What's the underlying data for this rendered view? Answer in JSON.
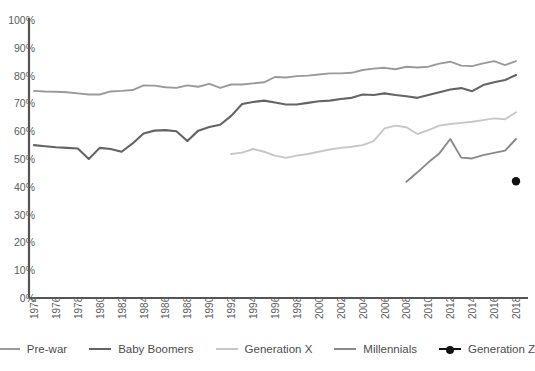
{
  "chart_data": {
    "type": "line",
    "title": "",
    "xlabel": "",
    "ylabel": "",
    "xlim": [
      1974,
      2018
    ],
    "ylim": [
      0,
      100
    ],
    "grid": false,
    "legend_position": "bottom",
    "y_ticks": [
      "100%",
      "90%",
      "80%",
      "70%",
      "60%",
      "50%",
      "40%",
      "30%",
      "20%",
      "10%",
      "0%"
    ],
    "y_tick_values": [
      100,
      90,
      80,
      70,
      60,
      50,
      40,
      30,
      20,
      10,
      0
    ],
    "x_ticks": [
      "1974",
      "1976",
      "1978",
      "1980",
      "1982",
      "1984",
      "1986",
      "1988",
      "1990",
      "1992",
      "1994",
      "1996",
      "1998",
      "2000",
      "2002",
      "2004",
      "2006",
      "2008",
      "2010",
      "2012",
      "2014",
      "2016",
      "2018"
    ],
    "x_tick_values": [
      1974,
      1976,
      1978,
      1980,
      1982,
      1984,
      1986,
      1988,
      1990,
      1992,
      1994,
      1996,
      1998,
      2000,
      2002,
      2004,
      2006,
      2008,
      2010,
      2012,
      2014,
      2016,
      2018
    ],
    "series": [
      {
        "name": "Pre-war",
        "color": "#9a9a9a",
        "width": 1.9,
        "marker": "none",
        "x": [
          1974,
          1975,
          1976,
          1977,
          1978,
          1979,
          1980,
          1981,
          1982,
          1983,
          1984,
          1985,
          1986,
          1987,
          1988,
          1989,
          1990,
          1991,
          1992,
          1993,
          1994,
          1995,
          1996,
          1997,
          1998,
          1999,
          2000,
          2001,
          2002,
          2003,
          2004,
          2005,
          2006,
          2007,
          2008,
          2009,
          2010,
          2011,
          2012,
          2013,
          2014,
          2015,
          2016,
          2017,
          2018
        ],
        "values": [
          74.5,
          74.3,
          74.2,
          74.0,
          73.6,
          73.2,
          73.2,
          74.3,
          74.5,
          74.8,
          76.5,
          76.4,
          75.8,
          75.6,
          76.5,
          76.0,
          77.0,
          75.6,
          76.8,
          76.8,
          77.2,
          77.6,
          79.5,
          79.3,
          79.8,
          80.0,
          80.4,
          80.8,
          80.8,
          81.0,
          82.0,
          82.5,
          82.8,
          82.3,
          83.2,
          82.9,
          83.2,
          84.3,
          85.0,
          83.6,
          83.4,
          84.4,
          85.2,
          83.8,
          85.2
        ]
      },
      {
        "name": "Baby Boomers",
        "color": "#646464",
        "width": 2.1,
        "marker": "none",
        "x": [
          1974,
          1975,
          1976,
          1977,
          1978,
          1979,
          1980,
          1981,
          1982,
          1983,
          1984,
          1985,
          1986,
          1987,
          1988,
          1989,
          1990,
          1991,
          1992,
          1993,
          1994,
          1995,
          1996,
          1997,
          1998,
          1999,
          2000,
          2001,
          2002,
          2003,
          2004,
          2005,
          2006,
          2007,
          2008,
          2009,
          2010,
          2011,
          2012,
          2013,
          2014,
          2015,
          2016,
          2017,
          2018
        ],
        "values": [
          55.0,
          54.6,
          54.2,
          54.0,
          53.8,
          50.0,
          54.0,
          53.6,
          52.6,
          55.6,
          59.2,
          60.2,
          60.4,
          60.0,
          56.5,
          60.2,
          61.5,
          62.3,
          65.5,
          69.8,
          70.5,
          71.0,
          70.3,
          69.6,
          69.6,
          70.2,
          70.8,
          71.0,
          71.6,
          72.0,
          73.2,
          73.0,
          73.6,
          73.0,
          72.6,
          72.0,
          73.0,
          74.0,
          75.0,
          75.5,
          74.4,
          76.6,
          77.6,
          78.4,
          80.2
        ]
      },
      {
        "name": "Generation X",
        "color": "#c7c7c7",
        "width": 1.9,
        "marker": "none",
        "x": [
          1992,
          1993,
          1994,
          1995,
          1996,
          1997,
          1998,
          1999,
          2000,
          2001,
          2002,
          2003,
          2004,
          2005,
          2006,
          2007,
          2008,
          2009,
          2010,
          2011,
          2012,
          2013,
          2014,
          2015,
          2016,
          2017,
          2018
        ],
        "values": [
          51.8,
          52.3,
          53.6,
          52.6,
          51.2,
          50.4,
          51.2,
          51.8,
          52.6,
          53.4,
          54.0,
          54.4,
          55.0,
          56.4,
          61.0,
          62.0,
          61.4,
          59.0,
          60.4,
          62.0,
          62.6,
          63.0,
          63.4,
          64.0,
          64.6,
          64.3,
          66.8
        ]
      },
      {
        "name": "Millennials",
        "color": "#8a8a8a",
        "width": 1.9,
        "marker": "none",
        "x": [
          2008,
          2009,
          2010,
          2011,
          2012,
          2013,
          2014,
          2015,
          2016,
          2017,
          2018
        ],
        "values": [
          41.8,
          45.2,
          48.8,
          52.0,
          57.2,
          50.5,
          50.2,
          51.4,
          52.2,
          53.0,
          57.2
        ]
      },
      {
        "name": "Generation Z",
        "color": "#111111",
        "width": 2.4,
        "marker": "dot",
        "x": [
          2018
        ],
        "values": [
          42.0
        ]
      }
    ]
  },
  "axis": {
    "line_color": "#555555"
  }
}
